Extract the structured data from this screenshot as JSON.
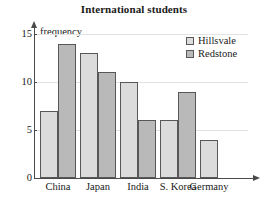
{
  "chart_data": {
    "type": "bar",
    "title": "International students",
    "xlabel": "",
    "ylabel": "frequency",
    "categories": [
      "China",
      "Japan",
      "India",
      "S. Korea",
      "Germany"
    ],
    "series": [
      {
        "name": "Hillsvale",
        "color": "#dcdcdc",
        "values": [
          7,
          13,
          10,
          6,
          4
        ]
      },
      {
        "name": "Redstone",
        "color": "#b9b9b9",
        "values": [
          14,
          11,
          6,
          9,
          null
        ]
      }
    ],
    "ylim": [
      0,
      15
    ],
    "yticks": [
      0,
      5,
      10,
      15
    ],
    "ytick_labels": [
      "0",
      "5",
      "10",
      "15"
    ],
    "grid": true,
    "legend_position": "top-right"
  },
  "axis": {
    "y_name": "frequency"
  }
}
